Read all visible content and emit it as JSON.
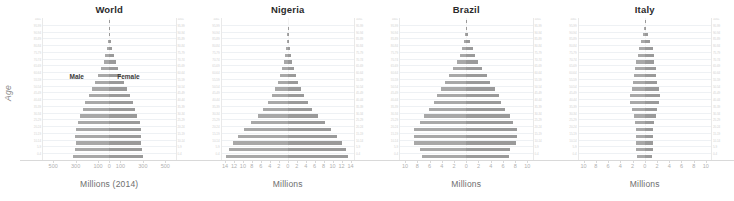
{
  "figure": {
    "ylabel": "Age",
    "age_groups": [
      "100+",
      "95-99",
      "90-94",
      "85-89",
      "80-84",
      "75-79",
      "70-74",
      "65-69",
      "60-64",
      "55-59",
      "50-54",
      "45-49",
      "40-44",
      "35-39",
      "30-34",
      "25-29",
      "20-24",
      "15-19",
      "10-14",
      "5-9",
      "0-4"
    ],
    "male_label": "Male",
    "female_label": "Female",
    "colors": {
      "male": "#a8a8a8",
      "female": "#9a9a9a",
      "grid": "#eef1f4",
      "axis": "#d9d9d9",
      "tick_text": "#b0b0b0",
      "age_text": "#d2d2d2"
    }
  },
  "chart_data": [
    {
      "type": "bar",
      "orientation": "horizontal-diverging",
      "title": "World",
      "xlabel": "Millions (2014)",
      "ylabel": "Age",
      "grid": true,
      "legend_position": "inside-plot",
      "annotations": [
        "Male",
        "Female"
      ],
      "xlim": [
        -600,
        600
      ],
      "xticks": [
        -500,
        -300,
        -100,
        0,
        100,
        300,
        500
      ],
      "xticklabels": [
        "500",
        "300",
        "100",
        "0",
        "100",
        "300",
        "500"
      ],
      "categories": [
        "100+",
        "95-99",
        "90-94",
        "85-89",
        "80-84",
        "75-79",
        "70-74",
        "65-69",
        "60-64",
        "55-59",
        "50-54",
        "45-49",
        "40-44",
        "35-39",
        "30-34",
        "25-29",
        "20-24",
        "15-19",
        "10-14",
        "5-9",
        "0-4"
      ],
      "series": [
        {
          "name": "Male",
          "values": [
            0.3,
            1.4,
            4.2,
            10.5,
            21.5,
            35.0,
            52.0,
            73.0,
            99.0,
            127.0,
            154.0,
            183.0,
            216.0,
            241.0,
            261.0,
            283.0,
            303.0,
            307.0,
            305.0,
            314.0,
            330.0
          ]
        },
        {
          "name": "Female",
          "values": [
            0.8,
            3.0,
            7.4,
            15.5,
            28.5,
            43.0,
            60.0,
            81.0,
            107.0,
            133.0,
            158.0,
            184.0,
            214.0,
            236.0,
            255.0,
            274.0,
            289.0,
            290.0,
            288.0,
            296.0,
            310.0
          ]
        }
      ]
    },
    {
      "type": "bar",
      "orientation": "horizontal-diverging",
      "title": "Nigeria",
      "xlabel": "Millions",
      "ylabel": "Age",
      "grid": true,
      "xlim": [
        -15,
        15
      ],
      "xticks": [
        -14,
        -12,
        -10,
        -8,
        -6,
        -4,
        -2,
        0,
        2,
        4,
        6,
        8,
        10,
        12,
        14
      ],
      "xticklabels": [
        "14",
        "12",
        "10",
        "8",
        "6",
        "4",
        "2",
        "0",
        "2",
        "4",
        "6",
        "8",
        "10",
        "12",
        "14"
      ],
      "categories": [
        "100+",
        "95-99",
        "90-94",
        "85-89",
        "80-84",
        "75-79",
        "70-74",
        "65-69",
        "60-64",
        "55-59",
        "50-54",
        "45-49",
        "40-44",
        "35-39",
        "30-34",
        "25-29",
        "20-24",
        "15-19",
        "10-14",
        "5-9",
        "0-4"
      ],
      "series": [
        {
          "name": "Male",
          "values": [
            0.01,
            0.03,
            0.08,
            0.2,
            0.4,
            0.6,
            0.9,
            1.3,
            1.8,
            2.3,
            2.9,
            3.6,
            4.5,
            5.5,
            6.8,
            8.3,
            9.9,
            11.3,
            12.5,
            13.3,
            13.9
          ]
        },
        {
          "name": "Female",
          "values": [
            0.01,
            0.04,
            0.1,
            0.25,
            0.45,
            0.7,
            1.0,
            1.4,
            1.9,
            2.4,
            3.0,
            3.7,
            4.6,
            5.6,
            6.9,
            8.4,
            9.9,
            11.2,
            12.3,
            13.1,
            13.7
          ]
        }
      ]
    },
    {
      "type": "bar",
      "orientation": "horizontal-diverging",
      "title": "Brazil",
      "xlabel": "Millions",
      "ylabel": "Age",
      "grid": true,
      "xlim": [
        -11,
        11
      ],
      "xticks": [
        -10,
        -8,
        -6,
        -4,
        -2,
        0,
        2,
        4,
        6,
        8,
        10
      ],
      "xticklabels": [
        "10",
        "8",
        "6",
        "4",
        "2",
        "0",
        "2",
        "4",
        "6",
        "8",
        "10"
      ],
      "categories": [
        "100+",
        "95-99",
        "90-94",
        "85-89",
        "80-84",
        "75-79",
        "70-74",
        "65-69",
        "60-64",
        "55-59",
        "50-54",
        "45-49",
        "40-44",
        "35-39",
        "30-34",
        "25-29",
        "20-24",
        "15-19",
        "10-14",
        "5-9",
        "0-4"
      ],
      "series": [
        {
          "name": "Male",
          "values": [
            0.01,
            0.06,
            0.2,
            0.4,
            0.75,
            1.1,
            1.6,
            2.2,
            2.9,
            3.5,
            4.2,
            4.9,
            5.4,
            6.2,
            7.0,
            7.6,
            8.6,
            8.7,
            8.6,
            7.6,
            7.4
          ]
        },
        {
          "name": "Female",
          "values": [
            0.03,
            0.12,
            0.35,
            0.65,
            1.1,
            1.5,
            2.0,
            2.6,
            3.4,
            4.0,
            4.7,
            5.4,
            5.8,
            6.5,
            7.2,
            7.7,
            8.5,
            8.5,
            8.3,
            7.3,
            7.1
          ]
        }
      ]
    },
    {
      "type": "bar",
      "orientation": "horizontal-diverging",
      "title": "Italy",
      "xlabel": "Millions",
      "ylabel": "Age",
      "grid": true,
      "xlim": [
        -11,
        11
      ],
      "xticks": [
        -10,
        -8,
        -6,
        -4,
        -2,
        0,
        2,
        4,
        6,
        8,
        10
      ],
      "xticklabels": [
        "10",
        "8",
        "6",
        "4",
        "2",
        "0",
        "2",
        "4",
        "6",
        "8",
        "10"
      ],
      "categories": [
        "100+",
        "95-99",
        "90-94",
        "85-89",
        "80-84",
        "75-79",
        "70-74",
        "65-69",
        "60-64",
        "55-59",
        "50-54",
        "45-49",
        "40-44",
        "35-39",
        "30-34",
        "25-29",
        "20-24",
        "15-19",
        "10-14",
        "5-9",
        "0-4"
      ],
      "series": [
        {
          "name": "Male",
          "values": [
            0.01,
            0.06,
            0.25,
            0.55,
            0.9,
            1.2,
            1.4,
            1.6,
            1.8,
            2.0,
            2.2,
            2.4,
            2.4,
            2.1,
            1.8,
            1.6,
            1.5,
            1.5,
            1.5,
            1.4,
            1.3
          ]
        },
        {
          "name": "Female",
          "values": [
            0.04,
            0.18,
            0.5,
            0.9,
            1.3,
            1.5,
            1.6,
            1.8,
            1.9,
            2.1,
            2.3,
            2.5,
            2.4,
            2.1,
            1.8,
            1.6,
            1.4,
            1.4,
            1.4,
            1.3,
            1.2
          ]
        }
      ]
    }
  ]
}
